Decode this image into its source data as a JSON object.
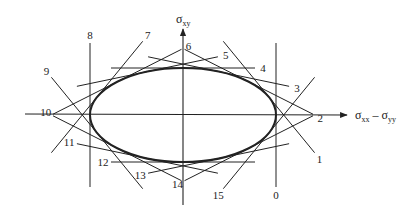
{
  "diagram": {
    "colors": {
      "ink": "#222222",
      "background": "#ffffff"
    },
    "axes": {
      "x_label_main": "σ",
      "x_label_sub1": "xx",
      "x_label_minus": " – σ",
      "x_label_sub2": "yy",
      "y_label_main": "σ",
      "y_label_sub": "xy"
    },
    "ellipse": {
      "cx": 183,
      "cy": 115,
      "rx": 93,
      "ry": 47
    },
    "tangent_lines": [
      {
        "id": "0",
        "label": "0",
        "angle_deg": 0
      },
      {
        "id": "1",
        "label": "1",
        "angle_deg": 22.5
      },
      {
        "id": "2",
        "label": "2",
        "angle_deg": 45
      },
      {
        "id": "3",
        "label": "3",
        "angle_deg": 67.5
      },
      {
        "id": "4",
        "label": "4",
        "angle_deg": 90
      },
      {
        "id": "5",
        "label": "5",
        "angle_deg": 112.5
      },
      {
        "id": "6",
        "label": "6",
        "angle_deg": 135
      },
      {
        "id": "7",
        "label": "7",
        "angle_deg": 157.5
      },
      {
        "id": "8",
        "label": "8",
        "angle_deg": 180
      },
      {
        "id": "9",
        "label": "9",
        "angle_deg": 202.5
      },
      {
        "id": "10",
        "label": "10",
        "angle_deg": 225
      },
      {
        "id": "11",
        "label": "11",
        "angle_deg": 247.5
      },
      {
        "id": "12",
        "label": "12",
        "angle_deg": 270
      },
      {
        "id": "13",
        "label": "13",
        "angle_deg": 292.5
      },
      {
        "id": "14",
        "label": "14",
        "angle_deg": 315
      },
      {
        "id": "15",
        "label": "15",
        "angle_deg": 337.5
      }
    ]
  }
}
